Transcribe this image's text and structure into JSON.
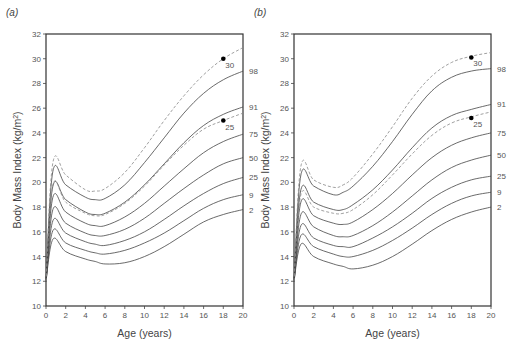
{
  "chart_data": [
    {
      "type": "line",
      "panel_label": "(a)",
      "title": "",
      "xlabel": "Age (years)",
      "ylabel": "Body Mass Index (kg/m2)",
      "xlim": [
        0,
        20
      ],
      "ylim": [
        10,
        32
      ],
      "xticks": [
        0,
        2,
        4,
        6,
        8,
        10,
        12,
        14,
        16,
        18,
        20
      ],
      "yticks": [
        10,
        12,
        14,
        16,
        18,
        20,
        22,
        24,
        26,
        28,
        30,
        32
      ],
      "grid": false,
      "x": [
        0,
        0.7,
        2,
        4,
        5,
        6,
        8,
        10,
        12,
        14,
        16,
        18,
        20
      ],
      "series": [
        {
          "name": "98",
          "style": "solid",
          "values": [
            12,
            20.9,
            19.8,
            18.8,
            18.6,
            18.7,
            19.8,
            21.6,
            23.6,
            25.6,
            27.2,
            28.3,
            29.0
          ]
        },
        {
          "name": "91",
          "style": "solid",
          "values": [
            12,
            19.7,
            18.6,
            17.6,
            17.4,
            17.5,
            18.4,
            19.8,
            21.5,
            23.2,
            24.6,
            25.5,
            26.1
          ]
        },
        {
          "name": "75",
          "style": "solid",
          "values": [
            12,
            18.8,
            17.6,
            16.7,
            16.5,
            16.5,
            17.2,
            18.3,
            19.7,
            21.1,
            22.4,
            23.3,
            23.9
          ]
        },
        {
          "name": "50",
          "style": "solid",
          "values": [
            12,
            17.8,
            16.7,
            15.9,
            15.7,
            15.7,
            16.2,
            17.1,
            18.3,
            19.5,
            20.6,
            21.5,
            22.0
          ]
        },
        {
          "name": "25",
          "style": "solid",
          "values": [
            12,
            16.9,
            15.9,
            15.2,
            15.0,
            14.9,
            15.3,
            16.0,
            17.0,
            18.1,
            19.1,
            19.9,
            20.4
          ]
        },
        {
          "name": "9",
          "style": "solid",
          "values": [
            12,
            16.1,
            15.1,
            14.5,
            14.3,
            14.2,
            14.5,
            15.1,
            15.9,
            16.9,
            17.9,
            18.6,
            19.0
          ]
        },
        {
          "name": "2",
          "style": "solid",
          "values": [
            12,
            15.4,
            14.4,
            13.8,
            13.6,
            13.4,
            13.5,
            14.0,
            14.8,
            15.8,
            16.8,
            17.4,
            17.8
          ]
        },
        {
          "name": "30 (cut-off)",
          "style": "dashed",
          "values": [
            12,
            21.6,
            20.6,
            19.4,
            19.3,
            19.5,
            20.8,
            22.8,
            25.0,
            27.0,
            28.7,
            30.0,
            30.9
          ]
        },
        {
          "name": "25 (cut-off)",
          "style": "dashed",
          "values": [
            12,
            19.8,
            18.4,
            17.5,
            17.3,
            17.4,
            18.3,
            19.7,
            21.4,
            23.0,
            24.3,
            25.0,
            25.6
          ]
        }
      ],
      "points": [
        {
          "label": "30",
          "x": 18,
          "y": 30
        },
        {
          "label": "25",
          "x": 18,
          "y": 25
        }
      ],
      "right_labels": [
        {
          "label": "98",
          "y": 29.0
        },
        {
          "label": "91",
          "y": 26.1
        },
        {
          "label": "75",
          "y": 23.9
        },
        {
          "label": "50",
          "y": 22.0
        },
        {
          "label": "25",
          "y": 20.4
        },
        {
          "label": "9",
          "y": 19.0
        },
        {
          "label": "2",
          "y": 17.8
        }
      ]
    },
    {
      "type": "line",
      "panel_label": "(b)",
      "title": "",
      "xlabel": "Age (years)",
      "ylabel": "Body Mass Index (kg/m2)",
      "xlim": [
        0,
        20
      ],
      "ylim": [
        10,
        32
      ],
      "xticks": [
        0,
        2,
        4,
        6,
        8,
        10,
        12,
        14,
        16,
        18,
        20
      ],
      "yticks": [
        10,
        12,
        14,
        16,
        18,
        20,
        22,
        24,
        26,
        28,
        30,
        32
      ],
      "grid": false,
      "x": [
        0,
        0.7,
        2,
        4,
        5,
        6,
        8,
        10,
        12,
        14,
        16,
        18,
        20
      ],
      "series": [
        {
          "name": "98",
          "style": "solid",
          "values": [
            12,
            20.6,
            19.7,
            19.0,
            19.2,
            19.7,
            21.3,
            23.3,
            25.5,
            27.4,
            28.5,
            29.0,
            29.2
          ]
        },
        {
          "name": "91",
          "style": "solid",
          "values": [
            12,
            19.4,
            18.4,
            17.8,
            17.8,
            18.2,
            19.4,
            21.0,
            22.8,
            24.4,
            25.4,
            25.9,
            26.3
          ]
        },
        {
          "name": "75",
          "style": "solid",
          "values": [
            12,
            18.4,
            17.3,
            16.7,
            16.6,
            16.8,
            17.8,
            19.1,
            20.6,
            22.0,
            23.0,
            23.6,
            24.0
          ]
        },
        {
          "name": "50",
          "style": "solid",
          "values": [
            12,
            17.4,
            16.4,
            15.7,
            15.6,
            15.7,
            16.5,
            17.6,
            18.9,
            20.2,
            21.2,
            21.8,
            22.2
          ]
        },
        {
          "name": "25",
          "style": "solid",
          "values": [
            12,
            16.5,
            15.5,
            14.9,
            14.8,
            14.8,
            15.5,
            16.4,
            17.5,
            18.7,
            19.6,
            20.2,
            20.5
          ]
        },
        {
          "name": "9",
          "style": "solid",
          "values": [
            12,
            15.7,
            14.8,
            14.2,
            14.0,
            14.0,
            14.5,
            15.3,
            16.3,
            17.4,
            18.3,
            18.9,
            19.2
          ]
        },
        {
          "name": "2",
          "style": "solid",
          "values": [
            12,
            15.0,
            14.0,
            13.4,
            13.2,
            13.0,
            13.3,
            14.0,
            15.0,
            16.1,
            17.0,
            17.6,
            18.0
          ]
        },
        {
          "name": "30 (cut-off)",
          "style": "dashed",
          "values": [
            12,
            21.3,
            20.2,
            19.6,
            19.8,
            20.4,
            22.3,
            24.5,
            26.8,
            28.6,
            29.7,
            30.2,
            30.5
          ]
        },
        {
          "name": "25 (cut-off)",
          "style": "dashed",
          "values": [
            12,
            19.0,
            18.0,
            17.5,
            17.5,
            17.8,
            19.0,
            20.6,
            22.3,
            23.8,
            24.8,
            25.3,
            25.7
          ]
        }
      ],
      "points": [
        {
          "label": "30",
          "x": 18,
          "y": 30.1
        },
        {
          "label": "25",
          "x": 18,
          "y": 25.2
        }
      ],
      "right_labels": [
        {
          "label": "98",
          "y": 29.2
        },
        {
          "label": "91",
          "y": 26.3
        },
        {
          "label": "75",
          "y": 24.0
        },
        {
          "label": "50",
          "y": 22.2
        },
        {
          "label": "25",
          "y": 20.5
        },
        {
          "label": "9",
          "y": 19.2
        },
        {
          "label": "2",
          "y": 18.0
        }
      ]
    }
  ],
  "colors": {
    "frame": "#333333",
    "curve": "#444444",
    "dashed": "#888888",
    "point": "#000000",
    "text": "#555555"
  }
}
